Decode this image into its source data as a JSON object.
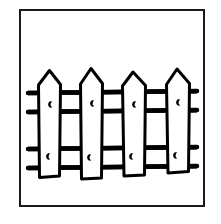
{
  "illustration": {
    "title": "Picket Fence",
    "subject": "wooden picket fence",
    "style": "black ink line art, coloring book page",
    "background_color": "#ffffff",
    "line_color": "#000000",
    "frame": {
      "present": true,
      "shape": "rectangle",
      "stroke_color": "#1a1a1a",
      "stroke_width": 2,
      "x": 19,
      "y": 9,
      "width": 186,
      "height": 198,
      "fill": "#ffffff"
    },
    "fence": {
      "picket_count": 4,
      "rail_count": 4,
      "picket_fill": "#ffffff",
      "picket_stroke": "#000000",
      "picket_stroke_width": 3,
      "rail_stroke": "#000000",
      "rail_stroke_width": 4,
      "pickets": [
        {
          "index": 1,
          "name": "picket-1",
          "left": 38,
          "right": 61,
          "tip_x": 49,
          "tip_y": 70,
          "shoulder_y": 84,
          "bottom_y": 176,
          "knots": [
            {
              "cx": 50,
              "cy": 104
            },
            {
              "cx": 48,
              "cy": 156
            }
          ]
        },
        {
          "index": 2,
          "name": "picket-2",
          "left": 80,
          "right": 103,
          "tip_x": 91,
          "tip_y": 68,
          "shoulder_y": 83,
          "bottom_y": 178,
          "knots": [
            {
              "cx": 92,
              "cy": 103
            },
            {
              "cx": 89,
              "cy": 157
            }
          ]
        },
        {
          "index": 3,
          "name": "picket-3",
          "left": 122,
          "right": 146,
          "tip_x": 133,
          "tip_y": 72,
          "shoulder_y": 86,
          "bottom_y": 175,
          "knots": [
            {
              "cx": 134,
              "cy": 104
            },
            {
              "cx": 131,
              "cy": 156
            }
          ]
        },
        {
          "index": 4,
          "name": "picket-4",
          "left": 166,
          "right": 190,
          "tip_x": 177,
          "tip_y": 69,
          "shoulder_y": 84,
          "bottom_y": 172,
          "knots": [
            {
              "cx": 178,
              "cy": 102
            },
            {
              "cx": 175,
              "cy": 155
            }
          ]
        }
      ],
      "rails": [
        {
          "index": 1,
          "name": "rail-upper-top",
          "y": 92,
          "x_start": 28,
          "x_end": 197
        },
        {
          "index": 2,
          "name": "rail-upper-bottom",
          "y": 111,
          "x_start": 28,
          "x_end": 197
        },
        {
          "index": 3,
          "name": "rail-lower-top",
          "y": 148,
          "x_start": 28,
          "x_end": 197
        },
        {
          "index": 4,
          "name": "rail-lower-bottom",
          "y": 167,
          "x_start": 28,
          "x_end": 197
        }
      ],
      "knot_mark": {
        "shape": "crescent",
        "description": "small comma-shaped wood knot",
        "color": "#000000",
        "width": 5,
        "height": 8
      }
    }
  }
}
